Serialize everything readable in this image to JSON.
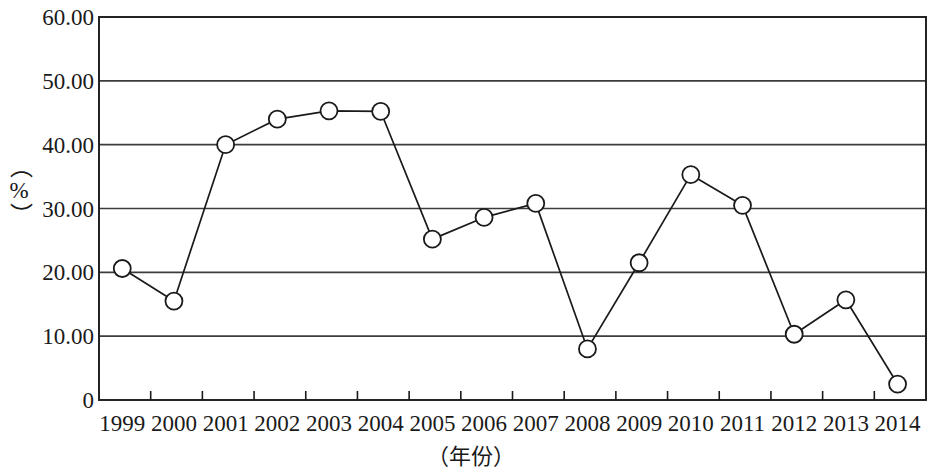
{
  "chart_data": {
    "type": "line",
    "title": "",
    "subtitle": "",
    "xlabel": "（年份）",
    "ylabel": "（%）",
    "categories": [
      "1999",
      "2000",
      "2001",
      "2002",
      "2003",
      "2004",
      "2005",
      "2006",
      "2007",
      "2008",
      "2009",
      "2010",
      "2011",
      "2012",
      "2013",
      "2014"
    ],
    "values": [
      20.6,
      15.5,
      40.0,
      44.0,
      45.3,
      45.2,
      25.2,
      28.6,
      30.8,
      8.0,
      21.5,
      35.3,
      30.5,
      10.3,
      15.7,
      2.5
    ],
    "series": [
      {
        "name": "",
        "values": [
          20.6,
          15.5,
          40.0,
          44.0,
          45.3,
          45.2,
          25.2,
          28.6,
          30.8,
          8.0,
          21.5,
          35.3,
          30.5,
          10.3,
          15.7,
          2.5
        ]
      }
    ],
    "ylim": [
      0,
      60
    ],
    "xlim": [
      "1999",
      "2014"
    ],
    "y_ticks": [
      0,
      10,
      20,
      30,
      40,
      50,
      60
    ],
    "y_tick_labels": [
      "0",
      "10.00",
      "20.00",
      "30.00",
      "40.00",
      "50.00",
      "60.00"
    ],
    "x_tick_labels": [
      "1999",
      "2000",
      "2001",
      "2002",
      "2003",
      "2004",
      "2005",
      "2006",
      "2007",
      "2008",
      "2009",
      "2010",
      "2011",
      "2012",
      "2013",
      "2014"
    ],
    "grid": true,
    "grid_axis": "y",
    "legend": false,
    "legend_position": "none",
    "marker": "open-circle",
    "line_color": "#1a1a1a",
    "marker_fill": "#ffffff",
    "marker_stroke": "#1a1a1a",
    "grid_color": "#3c3c3c",
    "frame_color": "#1a1a1a",
    "background": "#ffffff"
  },
  "layout": {
    "plot_left": 99,
    "plot_right": 926,
    "plot_top": 17,
    "plot_bottom": 400
  }
}
